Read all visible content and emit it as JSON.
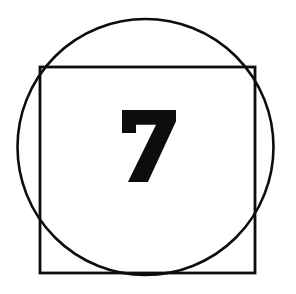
{
  "figure": {
    "title": "Numbered geometric figure",
    "canvas": {
      "width": 296,
      "height": 294,
      "background_color": "#ffffff"
    },
    "ink_color": "#0d0d0d",
    "shapes": {
      "circle": {
        "name": "circle-outline",
        "center_x": 145.5,
        "center_y": 147,
        "radius": 128,
        "stroke_width": 2.6,
        "stroke_color": "#0d0d0d",
        "fill": "none",
        "left_edge_x": 17,
        "right_edge_x": 274,
        "top_edge_y": 20,
        "bottom_edge_y": 275
      },
      "square": {
        "name": "square-outline",
        "x": 40,
        "y": 67,
        "width": 215,
        "height": 206,
        "stroke_width": 2.8,
        "stroke_color": "#0d0d0d",
        "fill": "none",
        "left_edge_x": 40,
        "right_edge_x": 255,
        "top_edge_y": 67,
        "bottom_edge_y": 273
      }
    },
    "label": {
      "name": "digit-seven",
      "text": "7",
      "color": "#0d0d0d",
      "bounds": {
        "x": 122,
        "y": 110,
        "width": 54,
        "height": 72
      },
      "center_x": 149,
      "center_y": 146,
      "style": "bold slab numeral with flagged top bar and thick diagonal stem"
    }
  }
}
